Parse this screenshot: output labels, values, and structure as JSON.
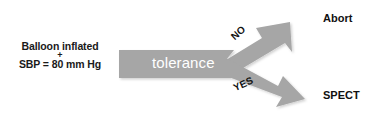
{
  "diagram": {
    "type": "flowchart",
    "canvas": {
      "width": 370,
      "height": 118,
      "background": "#ffffff"
    },
    "colors": {
      "arrow_gray": "#a6a6a6",
      "arrow_gray_shadow": "#bfbfbf",
      "text_dark": "#111111",
      "text_on_bar": "#ffffff"
    },
    "input": {
      "line1": "Balloon inflated",
      "operator": "+",
      "line2": "SBP = 80 mm Hg"
    },
    "process": {
      "label": "tolerance",
      "shape": "gray-bar-arrow"
    },
    "branches": [
      {
        "condition": "NO",
        "direction": "up-right",
        "outcome": "Abort"
      },
      {
        "condition": "YES",
        "direction": "down-right",
        "outcome": "SPECT"
      }
    ]
  }
}
